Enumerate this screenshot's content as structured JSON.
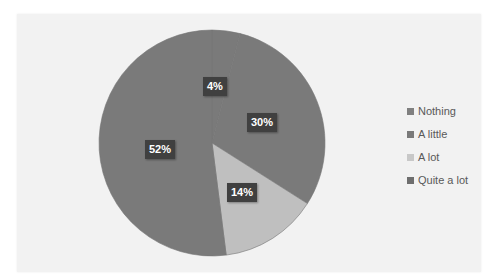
{
  "chart_data": {
    "type": "pie",
    "title": "",
    "categories": [
      "Nothing",
      "A little",
      "A lot",
      "Quite a lot"
    ],
    "values": [
      4,
      30,
      14,
      52
    ],
    "labels": [
      "4%",
      "30%",
      "14%",
      "52%"
    ],
    "colors": [
      "#7a7a7a",
      "#7a7a7a",
      "#bfbfbf",
      "#7a7a7a"
    ],
    "start_angle_deg": 0,
    "direction": "clockwise",
    "legend_position": "right",
    "data_labels": true
  },
  "legend": {
    "items": [
      {
        "label": "Nothing",
        "color": "#808080"
      },
      {
        "label": "A little",
        "color": "#7a7a7a"
      },
      {
        "label": "A lot",
        "color": "#c8c8c8"
      },
      {
        "label": "Quite a lot",
        "color": "#6e6e6e"
      }
    ]
  }
}
